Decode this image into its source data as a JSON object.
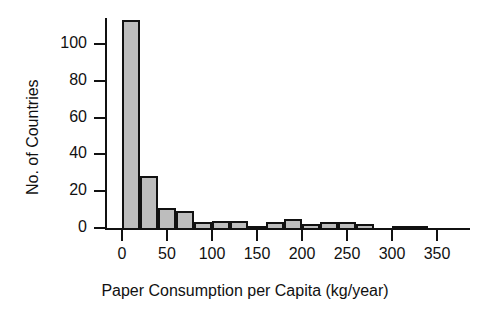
{
  "chart_data": {
    "type": "bar",
    "title": "",
    "subtitle": "",
    "xlabel": "Paper Consumption per Capita (kg/year)",
    "ylabel": "No. of Countries",
    "grid": false,
    "legend": false,
    "legend_position": "none",
    "bin_width": 20,
    "bin_start": 0,
    "xlim": [
      -5,
      390
    ],
    "ylim": [
      0,
      116
    ],
    "x_ticks": [
      0,
      50,
      100,
      150,
      200,
      250,
      300,
      350
    ],
    "x_tick_labels": [
      "0",
      "50",
      "100",
      "150",
      "200",
      "250",
      "300",
      "350"
    ],
    "y_ticks": [
      0,
      20,
      40,
      60,
      80,
      100
    ],
    "y_tick_labels": [
      "0",
      "20",
      "40",
      "60",
      "80",
      "100"
    ],
    "bar_fill_color": "#bdbdbd",
    "bar_edge_color": "#111111",
    "axis_color": "#111111",
    "background_color": "#ffffff",
    "categories": [
      "0-20",
      "20-40",
      "40-60",
      "60-80",
      "80-100",
      "100-120",
      "120-140",
      "140-160",
      "160-180",
      "180-200",
      "200-220",
      "220-240",
      "240-260",
      "260-280",
      "280-300",
      "300-320",
      "320-340"
    ],
    "bin_edges": [
      0,
      20,
      40,
      60,
      80,
      100,
      120,
      140,
      160,
      180,
      200,
      220,
      240,
      260,
      280,
      300,
      320,
      340
    ],
    "values": [
      113,
      28,
      11,
      9,
      3,
      4,
      4,
      1,
      3,
      5,
      2,
      3,
      3,
      2,
      0,
      1,
      1
    ]
  }
}
